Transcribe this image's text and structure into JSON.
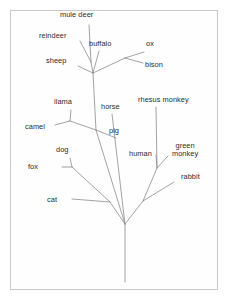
{
  "figure": {
    "kind": "phylogenetic-tree",
    "background_color": "#ffffff",
    "border_color": "#c8c8c8",
    "line_color": "#8c8c8c",
    "text_color": "#2b2b2b"
  },
  "chart_data": {
    "type": "diagram",
    "title": "",
    "xlabel": "",
    "ylabel": "",
    "leaf_labels": [
      "mule deer",
      "reindeer",
      "buffalo",
      "ox",
      "bison",
      "sheep",
      "llama",
      "horse",
      "rhesus monkey",
      "camel",
      "pig",
      "human",
      "green\nmonkey",
      "dog",
      "fox",
      "rabbit",
      "cat"
    ],
    "leaves": [
      {
        "name": "mule deer",
        "label_x": 60,
        "label_y": 11,
        "tip_x": 89,
        "tip_y": 25
      },
      {
        "name": "reindeer",
        "label_x": 39,
        "label_y": 32,
        "tip_x": 80,
        "tip_y": 41
      },
      {
        "name": "buffalo",
        "label_x": 89,
        "label_y": 40,
        "tip_x": 99,
        "tip_y": 51
      },
      {
        "name": "ox",
        "label_x": 146,
        "label_y": 40,
        "tip_x": 144,
        "tip_y": 52
      },
      {
        "name": "bison",
        "label_x": 145,
        "label_y": 61,
        "tip_x": 143,
        "tip_y": 63
      },
      {
        "name": "sheep",
        "label_x": 46,
        "label_y": 57,
        "tip_x": 78,
        "tip_y": 66
      },
      {
        "name": "llama",
        "label_x": 54,
        "label_y": 98,
        "tip_x": 71,
        "tip_y": 110
      },
      {
        "name": "horse",
        "label_x": 101,
        "label_y": 103,
        "tip_x": 112,
        "tip_y": 114
      },
      {
        "name": "rhesus monkey",
        "label_x": 138,
        "label_y": 96,
        "tip_x": 156,
        "tip_y": 107
      },
      {
        "name": "camel",
        "label_x": 25,
        "label_y": 123,
        "tip_x": 55,
        "tip_y": 125
      },
      {
        "name": "pig",
        "label_x": 109,
        "label_y": 127,
        "tip_x": 116,
        "tip_y": 138
      },
      {
        "name": "human",
        "label_x": 129,
        "label_y": 150,
        "tip_x": 156,
        "tip_y": 155
      },
      {
        "name": "green monkey",
        "label_x": 172,
        "label_y": 142,
        "tip_x": 168,
        "tip_y": 156
      },
      {
        "name": "dog",
        "label_x": 56,
        "label_y": 146,
        "tip_x": 70,
        "tip_y": 158
      },
      {
        "name": "fox",
        "label_x": 28,
        "label_y": 163,
        "tip_x": 62,
        "tip_y": 167
      },
      {
        "name": "rabbit",
        "label_x": 181,
        "label_y": 173,
        "tip_x": 174,
        "tip_y": 182
      },
      {
        "name": "cat",
        "label_x": 47,
        "label_y": 196,
        "tip_x": 72,
        "tip_y": 199
      }
    ],
    "nodes": [
      {
        "name": "deer-node",
        "x": 91,
        "y": 62
      },
      {
        "name": "ruminant-node",
        "x": 93,
        "y": 73
      },
      {
        "name": "bovid-node",
        "x": 125,
        "y": 58
      },
      {
        "name": "camelid-node",
        "x": 70,
        "y": 121
      },
      {
        "name": "artiodactyl-node",
        "x": 96,
        "y": 130
      },
      {
        "name": "canid-node",
        "x": 72,
        "y": 167
      },
      {
        "name": "carnivore-node",
        "x": 110,
        "y": 202
      },
      {
        "name": "primate-node",
        "x": 157,
        "y": 168
      },
      {
        "name": "glires-node",
        "x": 143,
        "y": 201
      },
      {
        "name": "root-node",
        "x": 125,
        "y": 224
      },
      {
        "name": "root-base",
        "x": 125,
        "y": 282
      }
    ],
    "edges": [
      [
        "mule deer",
        "deer-node"
      ],
      [
        "reindeer",
        "deer-node"
      ],
      [
        "deer-node",
        "ruminant-node"
      ],
      [
        "buffalo",
        "ruminant-node"
      ],
      [
        "sheep",
        "ruminant-node"
      ],
      [
        "ox",
        "bovid-node"
      ],
      [
        "bison",
        "bovid-node"
      ],
      [
        "bovid-node",
        "ruminant-node"
      ],
      [
        "ruminant-node",
        "artiodactyl-node"
      ],
      [
        "camel",
        "camelid-node"
      ],
      [
        "llama",
        "camelid-node"
      ],
      [
        "camelid-node",
        "artiodactyl-node"
      ],
      [
        "pig",
        "artiodactyl-node"
      ],
      [
        "artiodactyl-node",
        "root-node"
      ],
      [
        "horse",
        "root-node"
      ],
      [
        "fox",
        "canid-node"
      ],
      [
        "dog",
        "canid-node"
      ],
      [
        "canid-node",
        "carnivore-node"
      ],
      [
        "cat",
        "carnivore-node"
      ],
      [
        "carnivore-node",
        "root-node"
      ],
      [
        "rhesus monkey",
        "primate-node"
      ],
      [
        "human",
        "primate-node"
      ],
      [
        "green monkey",
        "primate-node"
      ],
      [
        "primate-node",
        "glires-node"
      ],
      [
        "rabbit",
        "glires-node"
      ],
      [
        "glires-node",
        "root-node"
      ],
      [
        "root-node",
        "root-base"
      ]
    ]
  }
}
